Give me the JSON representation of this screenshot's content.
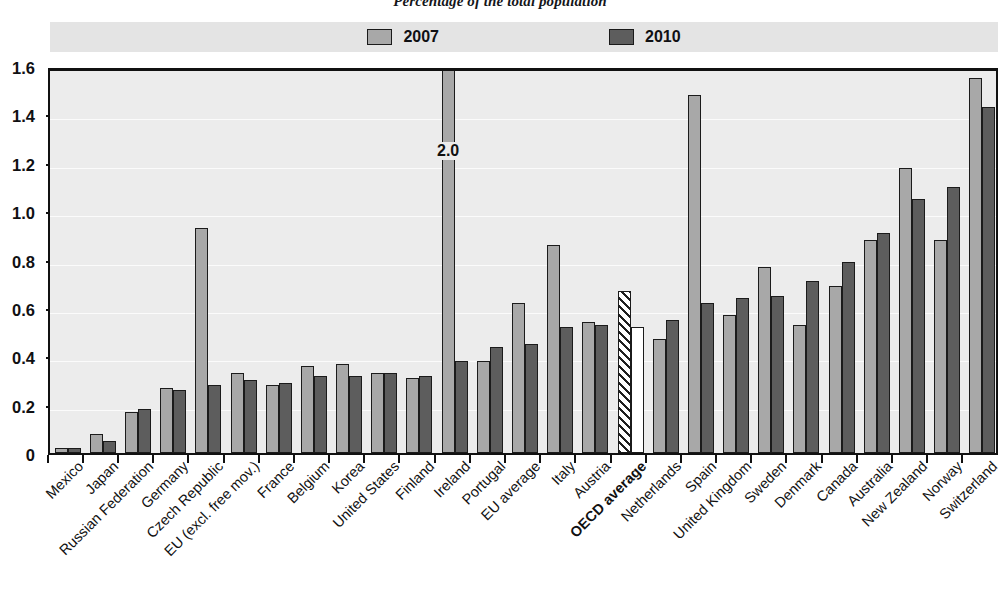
{
  "title": "Percentage of the total population",
  "legend": {
    "position": "top",
    "entries": [
      {
        "label": "2007",
        "color": "#a8a8a8"
      },
      {
        "label": "2010",
        "color": "#5d5d5d"
      }
    ]
  },
  "footnote": "",
  "annotations": [
    {
      "category": "Ireland",
      "series": "2007",
      "text": "2.0"
    }
  ],
  "chart_data": {
    "type": "bar",
    "title": "Percentage of the total population",
    "xlabel": "",
    "ylabel": "",
    "ylim": [
      0,
      1.6
    ],
    "yticks": [
      "0",
      "0.2",
      "0.4",
      "0.6",
      "0.8",
      "1.0",
      "1.2",
      "1.4",
      "1.6"
    ],
    "ytick_values": [
      0,
      0.2,
      0.4,
      0.6,
      0.8,
      1.0,
      1.2,
      1.4,
      1.6
    ],
    "grid": true,
    "categories": [
      "Mexico",
      "Japan",
      "Russian Federation",
      "Germany",
      "Czech Republic",
      "EU (excl. free mov.)",
      "France",
      "Belgium",
      "Korea",
      "United States",
      "Finland",
      "Ireland",
      "Portugal",
      "EU average",
      "Italy",
      "Austria",
      "OECD average",
      "Netherlands",
      "Spain",
      "United Kingdom",
      "Sweden",
      "Denmark",
      "Canada",
      "Australia",
      "New Zealand",
      "Norway",
      "Switzerland"
    ],
    "bold_categories": [
      "OECD average"
    ],
    "series": [
      {
        "name": "2007",
        "color": "#a8a8a8",
        "values": [
          0.02,
          0.08,
          0.17,
          0.27,
          0.93,
          0.33,
          0.28,
          0.36,
          0.37,
          0.33,
          0.31,
          2.0,
          0.38,
          0.62,
          0.86,
          0.54,
          0.67,
          0.47,
          1.48,
          0.57,
          0.77,
          0.53,
          0.69,
          0.88,
          1.18,
          0.88,
          1.55
        ]
      },
      {
        "name": "2010",
        "color": "#5d5d5d",
        "values": [
          0.02,
          0.05,
          0.18,
          0.26,
          0.28,
          0.3,
          0.29,
          0.32,
          0.32,
          0.33,
          0.32,
          0.38,
          0.44,
          0.45,
          0.52,
          0.53,
          0.52,
          0.55,
          0.62,
          0.64,
          0.65,
          0.71,
          0.79,
          0.91,
          1.05,
          1.1,
          1.43
        ]
      }
    ],
    "clipped_bars": [
      {
        "category": "Ireland",
        "series": "2007",
        "actual_value": 2.0,
        "label": "2.0"
      }
    ],
    "special_styles": [
      {
        "category": "OECD average",
        "series": "2007",
        "style": "hatched"
      },
      {
        "category": "OECD average",
        "series": "2010",
        "style": "hollow"
      }
    ]
  }
}
